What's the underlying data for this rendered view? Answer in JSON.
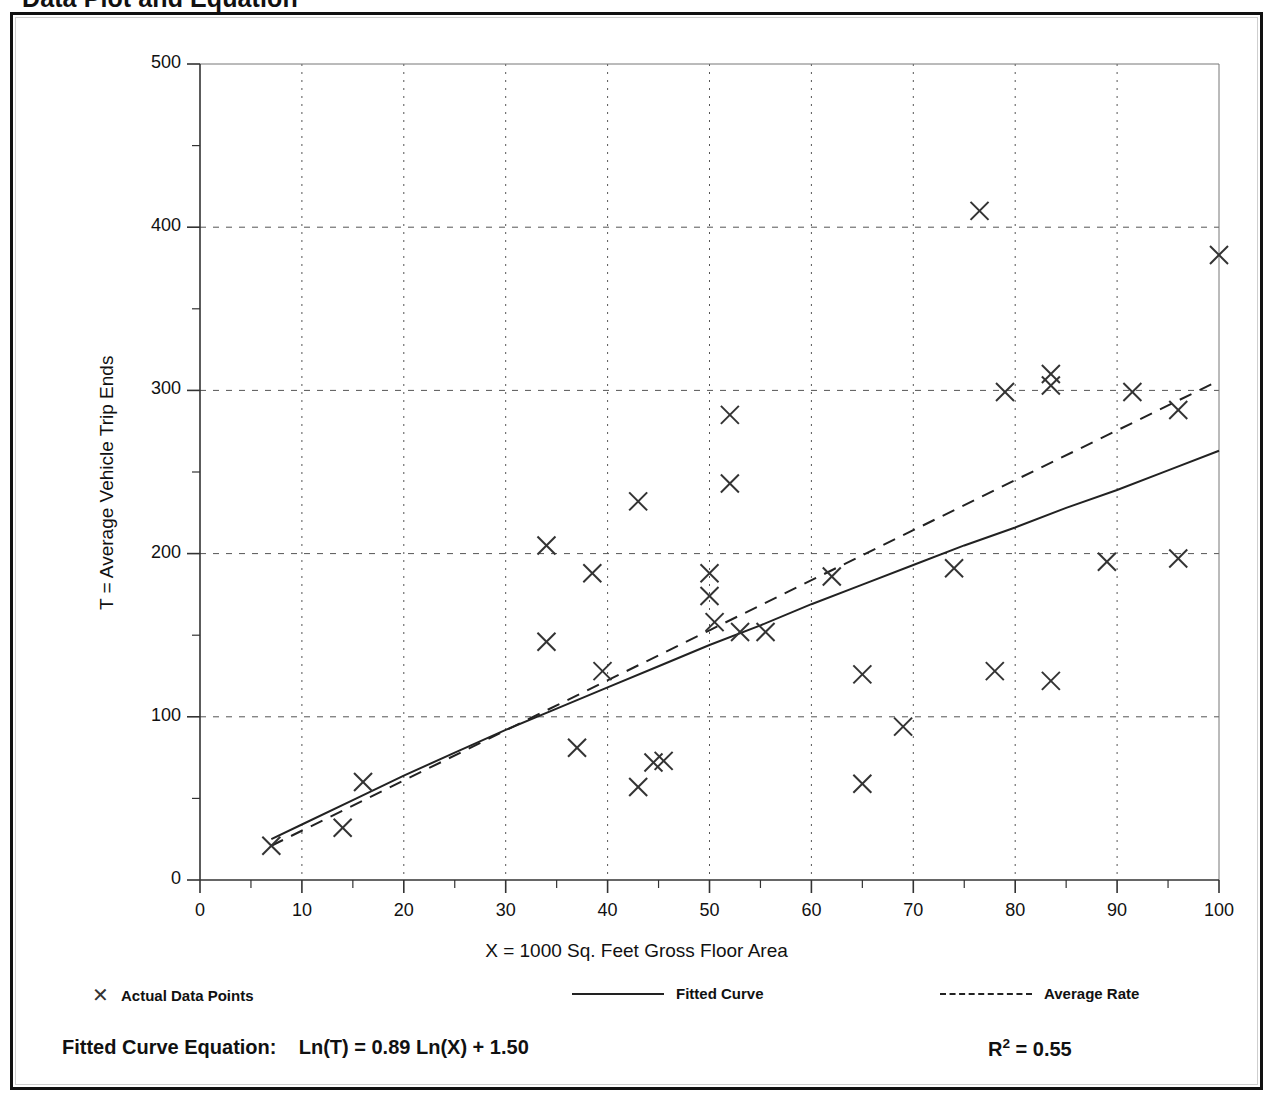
{
  "page": {
    "title": "Data Plot and Equation"
  },
  "legend": {
    "points_marker": "x-marker-icon",
    "points_label": "Actual Data Points",
    "fitted_marker": "solid-line-icon",
    "fitted_label": "Fitted Curve",
    "average_marker": "dashed-line-icon",
    "average_label": "Average Rate"
  },
  "equation": {
    "label": "Fitted Curve Equation:",
    "formula": "Ln(T) = 0.89 Ln(X) + 1.50",
    "r_squared_symbol": "R",
    "r_squared_exponent": "2",
    "r_squared_value": "= 0.55",
    "r_squared_full": "R2 = 0.55"
  },
  "chart_data": {
    "type": "scatter",
    "title": "Data Plot and Equation",
    "xlabel": "X = 1000 Sq. Feet Gross Floor Area",
    "ylabel": "T = Average Vehicle Trip Ends",
    "xlim": [
      0,
      100
    ],
    "ylim": [
      0,
      500
    ],
    "xticks": [
      0,
      10,
      20,
      30,
      40,
      50,
      60,
      70,
      80,
      90,
      100
    ],
    "yticks": [
      0,
      100,
      200,
      300,
      400,
      500
    ],
    "xminor_step": 5,
    "yminor_step": 50,
    "grid": "dotted-at-major-ticks",
    "legend_position": "below-axes",
    "series": [
      {
        "name": "Actual Data Points",
        "type": "scatter",
        "marker": "x",
        "color": "#333333",
        "points": [
          [
            7,
            21
          ],
          [
            14,
            32
          ],
          [
            16,
            60
          ],
          [
            34,
            205
          ],
          [
            34,
            146
          ],
          [
            37,
            81
          ],
          [
            38.5,
            188
          ],
          [
            39.5,
            128
          ],
          [
            43,
            232
          ],
          [
            43,
            57
          ],
          [
            44.5,
            72
          ],
          [
            45.5,
            73
          ],
          [
            50,
            188
          ],
          [
            50,
            174
          ],
          [
            50.5,
            158
          ],
          [
            52,
            285
          ],
          [
            52,
            243
          ],
          [
            53,
            152
          ],
          [
            55.5,
            152
          ],
          [
            62,
            186
          ],
          [
            65,
            126
          ],
          [
            65,
            59
          ],
          [
            69,
            94
          ],
          [
            74,
            191
          ],
          [
            76.5,
            410
          ],
          [
            78,
            128
          ],
          [
            79,
            299
          ],
          [
            83.5,
            310
          ],
          [
            83.5,
            303
          ],
          [
            83.5,
            122
          ],
          [
            89,
            195
          ],
          [
            91.5,
            299
          ],
          [
            96,
            288
          ],
          [
            96,
            197
          ],
          [
            100,
            383
          ]
        ]
      },
      {
        "name": "Fitted Curve",
        "type": "line",
        "style": "solid",
        "color": "#222222",
        "equation": "Ln(T) = 0.89 Ln(X) + 1.50",
        "coefficient_a": 0.89,
        "intercept_b": 1.5,
        "r_squared": 0.55,
        "points": [
          [
            7,
            25
          ],
          [
            10,
            34
          ],
          [
            15,
            49
          ],
          [
            20,
            64
          ],
          [
            25,
            78
          ],
          [
            30,
            92
          ],
          [
            35,
            105
          ],
          [
            40,
            118
          ],
          [
            45,
            131
          ],
          [
            50,
            144
          ],
          [
            55,
            156
          ],
          [
            60,
            169
          ],
          [
            65,
            181
          ],
          [
            70,
            193
          ],
          [
            75,
            205
          ],
          [
            80,
            216
          ],
          [
            85,
            228
          ],
          [
            90,
            239
          ],
          [
            95,
            251
          ],
          [
            100,
            263
          ]
        ]
      },
      {
        "name": "Average Rate",
        "type": "line",
        "style": "dashed",
        "color": "#222222",
        "points": [
          [
            7,
            21
          ],
          [
            20,
            61
          ],
          [
            35,
            107
          ],
          [
            50,
            153
          ],
          [
            65,
            199
          ],
          [
            80,
            245
          ],
          [
            100,
            306
          ]
        ]
      }
    ]
  }
}
